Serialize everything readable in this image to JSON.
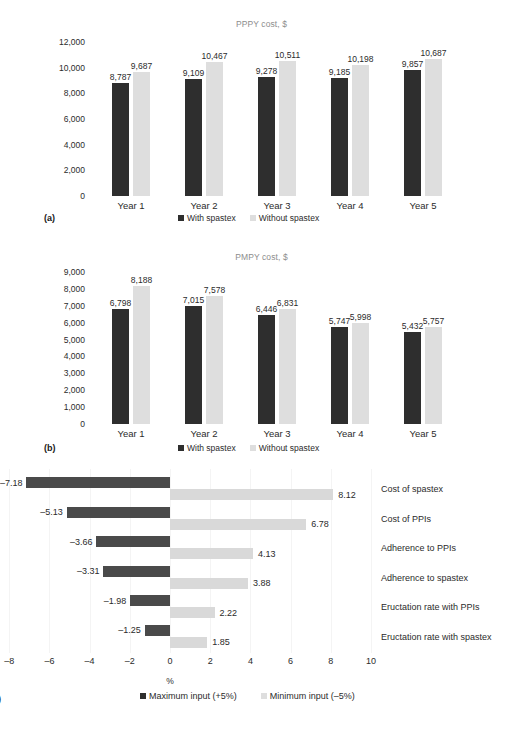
{
  "figure": {
    "panels": [
      {
        "letter": "(a)",
        "title": "PPPY cost, $",
        "legend": [
          {
            "label": "With spastex",
            "swatch": "dark"
          },
          {
            "label": "Without spastex",
            "swatch": "light"
          }
        ]
      },
      {
        "letter": "(b)",
        "title": "PMPY cost, $",
        "legend": [
          {
            "label": "With spastex",
            "swatch": "dark"
          },
          {
            "label": "Without spastex",
            "swatch": "light"
          }
        ]
      },
      {
        "letter": ")",
        "title": "",
        "legend": [
          {
            "label": "Maximum input (+5%)",
            "swatch": "dark"
          },
          {
            "label": "Minimum input (–5%)",
            "swatch": "light"
          }
        ]
      }
    ]
  },
  "chart_data": [
    {
      "type": "bar",
      "title": "PPPY cost, $",
      "xlabel": "",
      "ylabel": "",
      "ylim": [
        0,
        12000
      ],
      "yticks": [
        0,
        2000,
        4000,
        6000,
        8000,
        10000,
        12000
      ],
      "ytick_labels": [
        "0",
        "2,000",
        "4,000",
        "6,000",
        "8,000",
        "10,000",
        "12,000"
      ],
      "grid": false,
      "legend_position": "bottom",
      "categories": [
        "Year 1",
        "Year 2",
        "Year 3",
        "Year 4",
        "Year 5"
      ],
      "series": [
        {
          "name": "With spastex",
          "color": "#2e2e2e",
          "values": [
            8787,
            9109,
            9278,
            9185,
            9857
          ],
          "labels": [
            "8,787",
            "9,109",
            "9,278",
            "9,185",
            "9,857"
          ]
        },
        {
          "name": "Without spastex",
          "color": "#dedede",
          "values": [
            9687,
            10467,
            10511,
            10198,
            10687
          ],
          "labels": [
            "9,687",
            "10,467",
            "10,511",
            "10,198",
            "10,687"
          ]
        }
      ]
    },
    {
      "type": "bar",
      "title": "PMPY cost, $",
      "xlabel": "",
      "ylabel": "",
      "ylim": [
        0,
        9000
      ],
      "yticks": [
        0,
        1000,
        2000,
        3000,
        4000,
        5000,
        6000,
        7000,
        8000,
        9000
      ],
      "ytick_labels": [
        "0",
        "1,000",
        "2,000",
        "3,000",
        "4,000",
        "5,000",
        "6,000",
        "7,000",
        "8,000",
        "9,000"
      ],
      "grid": false,
      "legend_position": "bottom",
      "categories": [
        "Year 1",
        "Year 2",
        "Year 3",
        "Year 4",
        "Year 5"
      ],
      "series": [
        {
          "name": "With spastex",
          "color": "#2e2e2e",
          "values": [
            6798,
            7015,
            6446,
            5747,
            5432
          ],
          "labels": [
            "6,798",
            "7,015",
            "6,446",
            "5,747",
            "5,432"
          ]
        },
        {
          "name": "Without spastex",
          "color": "#dedede",
          "values": [
            8188,
            7578,
            6831,
            5998,
            5757
          ],
          "labels": [
            "8,188",
            "7,578",
            "6,831",
            "5,998",
            "5,757"
          ]
        }
      ]
    },
    {
      "type": "bar",
      "orientation": "horizontal",
      "subtype": "tornado",
      "title": "",
      "xlabel": "%",
      "ylabel": "",
      "xlim": [
        -8,
        10
      ],
      "xticks": [
        -8,
        -6,
        -4,
        -2,
        0,
        2,
        4,
        6,
        8,
        10
      ],
      "xtick_labels": [
        "–8",
        "–6",
        "–4",
        "–2",
        "0",
        "2",
        "4",
        "6",
        "8",
        "10"
      ],
      "grid": false,
      "legend_position": "bottom",
      "categories": [
        "Cost of spastex",
        "Cost of PPIs",
        "Adherence to PPIs",
        "Adherence to spastex",
        "Eructation rate with PPIs",
        "Eructation rate with spastex"
      ],
      "series": [
        {
          "name": "Maximum input (+5%)",
          "color": "#4a4a4a",
          "values": [
            -7.18,
            -5.13,
            -3.66,
            -3.31,
            -1.98,
            -1.25
          ],
          "labels": [
            "–7.18",
            "–5.13",
            "–3.66",
            "–3.31",
            "–1.98",
            "–1.25"
          ]
        },
        {
          "name": "Minimum input (–5%)",
          "color": "#d9d9d9",
          "values": [
            8.12,
            6.78,
            4.13,
            3.88,
            2.22,
            1.85
          ],
          "labels": [
            "8.12",
            "6.78",
            "4.13",
            "3.88",
            "2.22",
            "1.85"
          ]
        }
      ]
    }
  ]
}
